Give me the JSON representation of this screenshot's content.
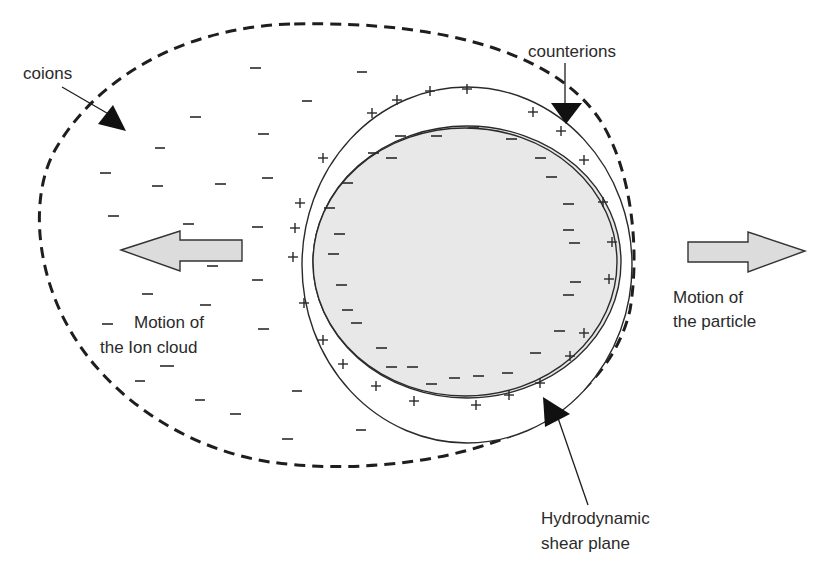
{
  "diagram": {
    "labels": {
      "coions": "coions",
      "counterions": "counterions",
      "ion_cloud_motion_line1": "Motion of",
      "ion_cloud_motion_line2": "the Ion cloud",
      "particle_motion_line1": "Motion of",
      "particle_motion_line2": "the particle",
      "shear_plane_line1": "Hydrodynamic",
      "shear_plane_line2": "shear plane"
    },
    "symbols": {
      "negative": "−",
      "positive": "+"
    },
    "colors": {
      "background": "#ffffff",
      "ink": "#1e1e1e",
      "particle_fill": "#e6e6e6",
      "arrow_fill": "#dcdcdc",
      "text": "#2a2a2a"
    }
  }
}
